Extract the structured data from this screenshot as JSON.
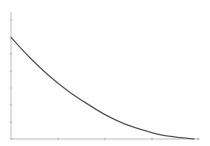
{
  "chart_data": {
    "type": "line",
    "title": "",
    "xlabel": "",
    "ylabel": "",
    "grid": false,
    "legend": null,
    "x_tick_labels": [],
    "y_tick_labels": [],
    "xlim": [
      0,
      1
    ],
    "ylim": [
      0,
      1
    ],
    "series": [
      {
        "name": "decay",
        "color": "#555555",
        "x": [
          0.0,
          0.1,
          0.2,
          0.3,
          0.4,
          0.5,
          0.6,
          0.7,
          0.8,
          0.9,
          0.97
        ],
        "y": [
          0.8,
          0.64,
          0.5,
          0.38,
          0.28,
          0.19,
          0.12,
          0.07,
          0.03,
          0.01,
          0.0
        ]
      }
    ]
  },
  "style": {
    "axis_color": "#bbbbbb",
    "line_color": "#555555",
    "background": "#ffffff"
  }
}
